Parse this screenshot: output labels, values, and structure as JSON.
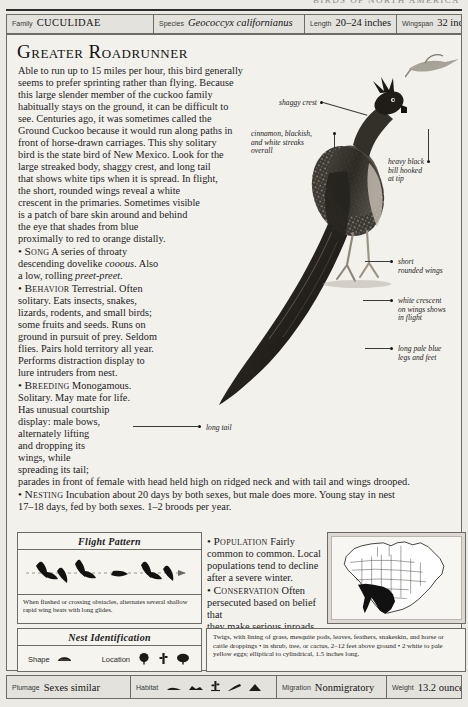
{
  "running_head": {
    "text": "BIRDS OF NORTH AMERICA"
  },
  "spec_header": [
    {
      "key": "Family",
      "value": "CUCULIDAE",
      "style": "smallcaps"
    },
    {
      "key": "Species",
      "value": "Geococcyx californianus",
      "style": "italic"
    },
    {
      "key": "Length",
      "value": "20–24 inches",
      "style": "plain"
    },
    {
      "key": "Wingspan",
      "value": "32 inches",
      "style": "plain"
    }
  ],
  "title": "Greater Roadrunner",
  "description": {
    "line1": "Able to run up to 15 miles per hour, this bird generally",
    "line2": "seems to prefer sprinting rather than flying. Because",
    "line3": "this large slender member of the cuckoo family",
    "line4": "habitually stays on the ground, it can be difficult to",
    "line5": "see. Centuries ago, it was sometimes called the",
    "line6": "Ground Cuckoo because it would run along paths in",
    "line7": "front of horse-drawn carriages. This shy solitary",
    "line8": "bird is the state bird of New Mexico. Look for the",
    "line9": "large streaked body, shaggy crest, and long tail",
    "line10": "that shows white tips when it is spread. In flight,",
    "line11": "the short, rounded wings reveal a white",
    "line12": "crescent in the primaries. Sometimes visible",
    "line13": "is a patch of bare skin around and behind",
    "line14": "the eye that shades from blue",
    "line15": "proximally to red to orange distally."
  },
  "sections": {
    "song": {
      "label": "Song",
      "t1": " A series of throaty",
      "t2": "descending dovelike ",
      "t2i": "cooous",
      "t2b": ". Also",
      "t3": "a low, rolling ",
      "t3i": "preet-preet",
      "t3b": "."
    },
    "behavior": {
      "label": "Behavior",
      "t1": " Terrestrial. Often",
      "t2": "solitary. Eats insects, snakes,",
      "t3": "lizards, rodents, and small birds;",
      "t4": "some fruits and seeds. Runs on",
      "t5": "ground in pursuit of prey. Seldom",
      "t6": "flies. Pairs hold territory all year.",
      "t7": "Performs distraction display to",
      "t8": "lure intruders from nest."
    },
    "breeding": {
      "label": "Breeding",
      "t1": " Monogamous.",
      "t2": "Solitary. May mate for life.",
      "t3": "Has unusual courtship",
      "t4": "display: male bows,",
      "t5": "alternately lifting",
      "t6": "and dropping its",
      "t7": "wings, while",
      "t8": "spreading its tail;",
      "t9": "parades in front of female with head held high on ridged neck and with tail and wings drooped."
    },
    "nesting": {
      "label": "Nesting",
      "t1": " Incubation about 20 days by both sexes, but male does more. Young stay in nest",
      "t2": "17–18 days, fed by both sexes. 1–2 broods per year."
    },
    "population": {
      "label": "Population",
      "t1": " Fairly",
      "t2": "common to common. Local",
      "t3": "populations tend to decline",
      "t4": "after a severe winter."
    },
    "conservation": {
      "label": "Conservation",
      "t1": " Often",
      "t2": "persecuted based on belief that",
      "t3": "they make serious inroads on",
      "t4": "quail populations."
    }
  },
  "annotations": [
    {
      "id": "shaggy-crest",
      "text": "shaggy crest"
    },
    {
      "id": "streaks",
      "text": "cinnamon, blackish,\nand white streaks\noverall"
    },
    {
      "id": "bill",
      "text": "heavy black\nbill hooked\nat tip"
    },
    {
      "id": "wings",
      "text": "short\nrounded wings"
    },
    {
      "id": "crescent",
      "text": "white crescent\non wings shows\nin flight"
    },
    {
      "id": "legs",
      "text": "long pale blue\nlegs and feet"
    },
    {
      "id": "long-tail",
      "text": "long tail"
    }
  ],
  "flight_pattern": {
    "title": "Flight Pattern",
    "caption": "When flushed or crossing obstacles, alternates several shallow rapid wing beats with long glides."
  },
  "nest_identification": {
    "title": "Nest Identification",
    "shape_label": "Shape",
    "location_label": "Location",
    "text": "Twigs, with lining of grass, mesquite pods, leaves, feathers, snakeskin, and horse or cattle droppings • in shrub, tree, or cactus, 2–12 feet above ground • 2 white to pale yellow eggs; elliptical to cylindrical, 1.5 inches long."
  },
  "spec_footer": [
    {
      "key": "Plumage",
      "value": "Sexes similar"
    },
    {
      "key": "Habitat",
      "value": ""
    },
    {
      "key": "Migration",
      "value": "Nonmigratory"
    },
    {
      "key": "Weight",
      "value": "13.2 ounces"
    }
  ],
  "colors": {
    "page_bg": "#eceae5",
    "panel_bg": "#f3f1ec",
    "rule": "#6d6b66",
    "ink": "#1a1a1a",
    "map_range": "#111111"
  }
}
